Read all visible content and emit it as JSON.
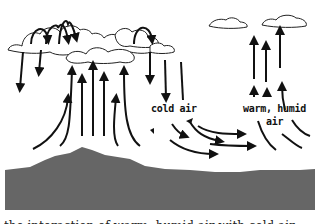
{
  "diagram": {
    "title": "",
    "labels": {
      "cold_air": "cold air",
      "warm_humid_line1": "warm, humid",
      "warm_humid_line2": "air"
    },
    "elements": {
      "left_cloud_mass": "large cumulus cloud over mountain",
      "right_clouds": [
        "small cloud",
        "small cloud"
      ],
      "ground": "mountain terrain",
      "ground_color": "#666666"
    },
    "bottom_caption_cut": "the interaction of warm, humid air with cold air"
  }
}
